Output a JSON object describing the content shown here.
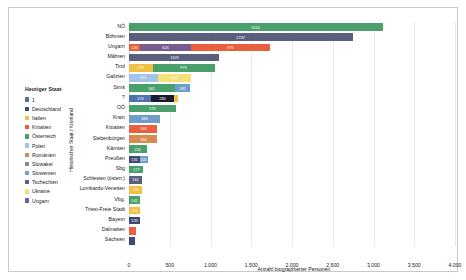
{
  "chart_data": {
    "type": "bar",
    "orientation": "horizontal",
    "stacked": true,
    "title": "",
    "xlabel": "Anzahl biographierter Personen",
    "ylabel": "Historischer Staat / Kronland",
    "xlim": [
      0,
      4000
    ],
    "xticks": [
      0,
      500,
      1000,
      1500,
      2000,
      2500,
      3000,
      3500,
      4000
    ],
    "xticklabels": [
      "0",
      "500",
      "1.000",
      "1.500",
      "2.000",
      "2.500",
      "3.000",
      "3.500",
      "4.000"
    ],
    "grid": true,
    "legend": {
      "title": "Heutiger Staat",
      "position": "left-outside",
      "entries": [
        {
          "label": "1",
          "color": "#4c72b0"
        },
        {
          "label": "Deutschland",
          "color": "#3d4a78"
        },
        {
          "label": "Italien",
          "color": "#f0c040"
        },
        {
          "label": "Kroatien",
          "color": "#e8603c"
        },
        {
          "label": "Österreich",
          "color": "#4aa06a"
        },
        {
          "label": "Polen",
          "color": "#9fc5e8"
        },
        {
          "label": "Rumänien",
          "color": "#d98a50"
        },
        {
          "label": "Slowakei",
          "color": "#8f7fa8"
        },
        {
          "label": "Slowenien",
          "color": "#6f9ecb"
        },
        {
          "label": "Tschechien",
          "color": "#5a5f7d"
        },
        {
          "label": "Ukraine",
          "color": "#f5e07a"
        },
        {
          "label": "Ungarn",
          "color": "#7b5a8f"
        }
      ]
    },
    "categories": [
      "NÖ",
      "Böhmen",
      "Ungarn",
      "Mähren",
      "Tirol",
      "Galizien",
      "Stmk",
      "?",
      "OÖ",
      "Krain",
      "Kroatien",
      "Siebenbürgen",
      "Kärnten",
      "Preußen",
      "Sbg",
      "Schlesien (österr.)",
      "Lombardo-Venetien",
      "Vbg.",
      "Triest-Freie Stadt",
      "Bayern",
      "Dalmatien",
      "Sachsen"
    ],
    "bars": [
      {
        "category": "NÖ",
        "total": 3114,
        "segments": [
          {
            "group": "Österreich",
            "value": 3114,
            "color": "#4aa06a",
            "label": "3114"
          }
        ]
      },
      {
        "category": "Böhmen",
        "total": 2747,
        "segments": [
          {
            "group": "Tschechien",
            "value": 2747,
            "color": "#5a5f7d",
            "label": "2747"
          }
        ]
      },
      {
        "category": "Ungarn",
        "total": 1960,
        "segments": [
          {
            "group": "Kroatien",
            "value": 136,
            "color": "#e8603c",
            "label": "136"
          },
          {
            "group": "Ungarn",
            "value": 624,
            "color": "#7b5a8f",
            "label": "624"
          },
          {
            "group": "Slowakei",
            "value": 975,
            "color": "#e8603c",
            "label": "975"
          }
        ]
      },
      {
        "category": "Mähren",
        "total": 1109,
        "segments": [
          {
            "group": "Tschechien",
            "value": 1109,
            "color": "#5a5f7d",
            "label": "1109"
          }
        ]
      },
      {
        "category": "Tirol",
        "total": 1052,
        "segments": [
          {
            "group": "Italien",
            "value": 373,
            "color": "#f0c040",
            "label": "373"
          },
          {
            "group": "Österreich",
            "value": 979,
            "color": "#4aa06a",
            "label": "979"
          }
        ]
      },
      {
        "category": "Galizien",
        "total": 766,
        "segments": [
          {
            "group": "Polen",
            "value": 375,
            "color": "#9fc5e8",
            "label": "375"
          },
          {
            "group": "Ukraine",
            "value": 422,
            "color": "#f5e07a",
            "label": "422"
          }
        ]
      },
      {
        "category": "Stmk",
        "total": 745,
        "segments": [
          {
            "group": "Österreich",
            "value": 562,
            "color": "#4aa06a",
            "label": "562"
          },
          {
            "group": "Slowenien",
            "value": 182,
            "color": "#6f9ecb",
            "label": "182"
          }
        ]
      },
      {
        "category": "?",
        "total": 603,
        "segments": [
          {
            "group": "1",
            "value": 274,
            "color": "#4c72b0",
            "label": "274"
          },
          {
            "group": "Deutschland",
            "value": 280,
            "color": "#1a1a2e",
            "label": "280"
          },
          {
            "group": "Italien",
            "value": 49,
            "color": "#f0c040",
            "label": ""
          }
        ]
      },
      {
        "category": "OÖ",
        "total": 575,
        "segments": [
          {
            "group": "Österreich",
            "value": 575,
            "color": "#4aa06a",
            "label": "575"
          }
        ]
      },
      {
        "category": "Krain",
        "total": 383,
        "segments": [
          {
            "group": "Slowenien",
            "value": 383,
            "color": "#6f9ecb",
            "label": "383"
          }
        ]
      },
      {
        "category": "Kroatien",
        "total": 344,
        "segments": [
          {
            "group": "Kroatien",
            "value": 344,
            "color": "#e8603c",
            "label": "344"
          }
        ]
      },
      {
        "category": "Siebenbürgen",
        "total": 344,
        "segments": [
          {
            "group": "Rumänien",
            "value": 344,
            "color": "#d98a50",
            "label": "344"
          }
        ]
      },
      {
        "category": "Kärnten",
        "total": 216,
        "segments": [
          {
            "group": "Österreich",
            "value": 216,
            "color": "#4aa06a",
            "label": "216"
          }
        ]
      },
      {
        "category": "Preußen",
        "total": 232,
        "segments": [
          {
            "group": "Deutschland",
            "value": 131,
            "color": "#3d4a78",
            "label": "131"
          },
          {
            "group": "Polen",
            "value": 101,
            "color": "#6f9ecb",
            "label": "101"
          }
        ]
      },
      {
        "category": "Sbg",
        "total": 177,
        "segments": [
          {
            "group": "Österreich",
            "value": 177,
            "color": "#4aa06a",
            "label": "177"
          }
        ]
      },
      {
        "category": "Schlesien (österr.)",
        "total": 161,
        "segments": [
          {
            "group": "Tschechien",
            "value": 161,
            "color": "#5a5f7d",
            "label": "161"
          }
        ]
      },
      {
        "category": "Lombardo-Venetien",
        "total": 158,
        "segments": [
          {
            "group": "Italien",
            "value": 158,
            "color": "#f0c040",
            "label": "158"
          }
        ]
      },
      {
        "category": "Vbg.",
        "total": 141,
        "segments": [
          {
            "group": "Österreich",
            "value": 141,
            "color": "#4aa06a",
            "label": "141"
          }
        ]
      },
      {
        "category": "Triest-Freie Stadt",
        "total": 131,
        "segments": [
          {
            "group": "Italien",
            "value": 131,
            "color": "#f0c040",
            "label": "131"
          }
        ]
      },
      {
        "category": "Bayern",
        "total": 139,
        "segments": [
          {
            "group": "Deutschland",
            "value": 139,
            "color": "#3d4a78",
            "label": "139"
          }
        ]
      },
      {
        "category": "Dalmatien",
        "total": 83,
        "segments": [
          {
            "group": "Kroatien",
            "value": 83,
            "color": "#e8603c",
            "label": ""
          }
        ]
      },
      {
        "category": "Sachsen",
        "total": 78,
        "segments": [
          {
            "group": "Deutschland",
            "value": 78,
            "color": "#3d4a78",
            "label": ""
          }
        ]
      }
    ]
  }
}
